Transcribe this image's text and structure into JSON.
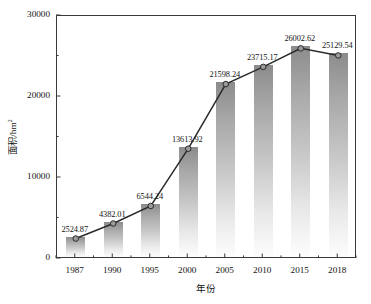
{
  "chart_data": {
    "type": "bar",
    "title": "",
    "subtitle": "",
    "xlabel": "年份",
    "ylabel": "面积/hm²",
    "ylabel_base": "面积/hm",
    "ylabel_sup": "2",
    "categories": [
      "1987",
      "1990",
      "1995",
      "2000",
      "2005",
      "2010",
      "2015",
      "2018"
    ],
    "values": [
      2524.87,
      4382.01,
      6544.24,
      13613.92,
      21598.24,
      23715.17,
      26002.62,
      25129.54
    ],
    "value_labels": [
      "2524.87",
      "4382.01",
      "6544.24",
      "13613.92",
      "21598.24",
      "23715.17",
      "26002.62",
      "25129.54"
    ],
    "series": [
      {
        "name": "面积",
        "kind": "bar",
        "values": [
          2524.87,
          4382.01,
          6544.24,
          13613.92,
          21598.24,
          23715.17,
          26002.62,
          25129.54
        ]
      },
      {
        "name": "趋势线",
        "kind": "line",
        "values": [
          2524.87,
          4382.01,
          6544.24,
          13613.92,
          21598.24,
          23715.17,
          26002.62,
          25129.54
        ]
      }
    ],
    "ylim": [
      0,
      30000
    ],
    "ytick_labels": [
      "0",
      "10000",
      "20000",
      "30000"
    ],
    "ytick_values": [
      0,
      10000,
      20000,
      30000
    ],
    "yminor_values": [
      5000,
      15000,
      25000
    ],
    "grid": false,
    "legend": "none",
    "colors": {
      "bar_top": "#8c8c8c",
      "bar_bottom": "#fdfdfd",
      "line": "#2b2b2b",
      "marker_fill": "#9a9a9a",
      "marker_edge": "#2b2b2b",
      "axis": "#3a3a3a",
      "text": "#141414",
      "background": "#ffffff"
    }
  }
}
